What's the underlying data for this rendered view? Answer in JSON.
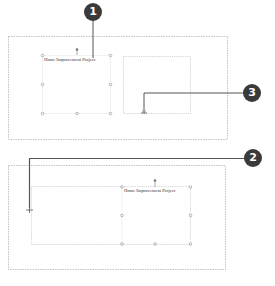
{
  "diagram": {
    "colors": {
      "callout": "#3a3a3a",
      "frame": "#b0b0b0",
      "guide": "#c4c4c4",
      "handle": "#8a8a8a",
      "background": "#ffffff"
    },
    "top_panel": {
      "text_box_label": "Home Improvement Project",
      "callouts": [
        {
          "number": "1",
          "target": "text-box-top-edge"
        },
        {
          "number": "3",
          "target": "drag-destination-cursor"
        }
      ]
    },
    "bottom_panel": {
      "text_box_label": "Home Improvement Project",
      "callouts": [
        {
          "number": "2",
          "target": "resize-cursor-left-edge"
        }
      ]
    }
  }
}
